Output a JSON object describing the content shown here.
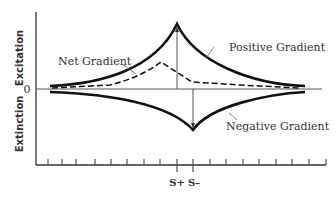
{
  "diagram": {
    "type": "peak-shift gradient diagram",
    "y_axis": {
      "upper_label": "Excitation",
      "lower_label": "Extinction",
      "zero_label": "0"
    },
    "x_axis": {
      "tick_count": 18,
      "stimulus_labels": {
        "s_plus": "S+",
        "s_minus": "S–"
      }
    },
    "curves": [
      {
        "name": "Positive Gradient",
        "style": "solid thick",
        "peak_at": "S+"
      },
      {
        "name": "Negative Gradient",
        "style": "solid thick",
        "trough_at": "S–"
      },
      {
        "name": "Net Gradient",
        "style": "dashed",
        "peak": "shifted left of S+"
      }
    ],
    "labels": {
      "net": "Net Gradient",
      "positive": "Positive Gradient",
      "negative": "Negative Gradient"
    },
    "colors": {
      "line": "#111111",
      "axis": "#333333",
      "thin": "#666666"
    }
  }
}
